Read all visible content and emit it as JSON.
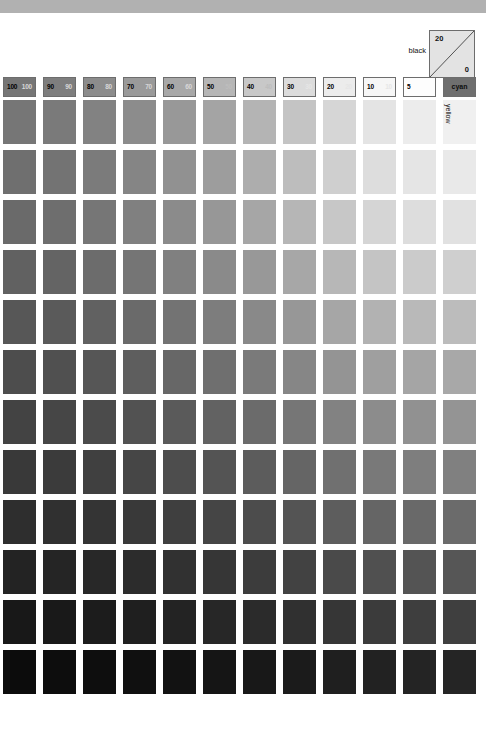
{
  "chart_data": {
    "type": "heatmap",
    "xlabel": "cyan",
    "ylabel": "yellow",
    "grid": false,
    "legend_position": "none",
    "annotations": {
      "corner_label": "black",
      "corner_top_value": "20",
      "corner_bottom_value": "0",
      "cyan_header_label": "cyan",
      "yellow_axis_label": "yellow"
    },
    "columns": [
      {
        "label": "100",
        "secondary": "100",
        "tint": 100
      },
      {
        "label": "90",
        "secondary": "90",
        "tint": 90
      },
      {
        "label": "80",
        "secondary": "80",
        "tint": 80
      },
      {
        "label": "70",
        "secondary": "70",
        "tint": 70
      },
      {
        "label": "60",
        "secondary": "60",
        "tint": 60
      },
      {
        "label": "50",
        "secondary": "50",
        "tint": 50
      },
      {
        "label": "40",
        "secondary": "40",
        "tint": 40
      },
      {
        "label": "30",
        "secondary": "30",
        "tint": 30
      },
      {
        "label": "20",
        "secondary": "20",
        "tint": 20
      },
      {
        "label": "10",
        "secondary": "10",
        "tint": 10
      },
      {
        "label": "5",
        "secondary": "",
        "tint": 5
      },
      {
        "label": "cyan",
        "secondary": "",
        "tint": -1
      }
    ],
    "rows": [
      {
        "label": "0",
        "secondary": "",
        "tint": 0
      },
      {
        "label": "5",
        "secondary": "",
        "tint": 5
      },
      {
        "label": "10",
        "secondary": "",
        "tint": 10
      },
      {
        "label": "20",
        "secondary": "20",
        "tint": 20
      },
      {
        "label": "30",
        "secondary": "30",
        "tint": 30
      },
      {
        "label": "40",
        "secondary": "40",
        "tint": 40
      },
      {
        "label": "50",
        "secondary": "50",
        "tint": 50
      },
      {
        "label": "60",
        "secondary": "60",
        "tint": 60
      },
      {
        "label": "70",
        "secondary": "70",
        "tint": 70
      },
      {
        "label": "80",
        "secondary": "80",
        "tint": 80
      },
      {
        "label": "90",
        "secondary": "90",
        "tint": 90
      },
      {
        "label": "100",
        "secondary": "100",
        "tint": 100
      }
    ],
    "header_colors": [
      "#767676",
      "#7e7e7e",
      "#8c8c8c",
      "#9a9a9a",
      "#a8a8a8",
      "#b6b6b6",
      "#c8c8c8",
      "#dcdcdc",
      "#ececec",
      "#f6f6f6",
      "#fdfdfd",
      "#6f6f6f"
    ],
    "row_label_colors": [
      "#0a0a0a",
      "#ffffff",
      "#fbfbfb",
      "#e2e2e2",
      "#c9c9c9",
      "#b2b2b2",
      "#9c9c9c",
      "#858585",
      "#6c6c6c",
      "#535353",
      "#373737",
      "#1a1a1a"
    ],
    "patch_colors": [
      [
        "#767676",
        "#7a7a7a",
        "#828282",
        "#8c8c8c",
        "#989898",
        "#a4a4a4",
        "#b4b4b4",
        "#c4c4c4",
        "#d6d6d6",
        "#e4e4e4",
        "#ececec",
        "#f0f0f0"
      ],
      [
        "#6f6f6f",
        "#737373",
        "#7b7b7b",
        "#858585",
        "#919191",
        "#9d9d9d",
        "#adadad",
        "#bdbdbd",
        "#cfcfcf",
        "#dddddd",
        "#e5e5e5",
        "#e9e9e9"
      ],
      [
        "#6a6a6a",
        "#6e6e6e",
        "#767676",
        "#808080",
        "#8b8b8b",
        "#979797",
        "#a6a6a6",
        "#b6b6b6",
        "#c7c7c7",
        "#d5d5d5",
        "#dddddd",
        "#e1e1e1"
      ],
      [
        "#616161",
        "#646464",
        "#6c6c6c",
        "#757575",
        "#808080",
        "#8a8a8a",
        "#989898",
        "#a7a7a7",
        "#b7b7b7",
        "#c4c4c4",
        "#cbcbcb",
        "#cfcfcf"
      ],
      [
        "#575757",
        "#5a5a5a",
        "#616161",
        "#6a6a6a",
        "#737373",
        "#7d7d7d",
        "#898989",
        "#979797",
        "#a6a6a6",
        "#b2b2b2",
        "#b9b9b9",
        "#bcbcbc"
      ],
      [
        "#4d4d4d",
        "#505050",
        "#565656",
        "#5e5e5e",
        "#676767",
        "#6f6f6f",
        "#7a7a7a",
        "#868686",
        "#949494",
        "#9f9f9f",
        "#a5a5a5",
        "#a8a8a8"
      ],
      [
        "#434343",
        "#464646",
        "#4b4b4b",
        "#525252",
        "#5a5a5a",
        "#626262",
        "#6b6b6b",
        "#767676",
        "#828282",
        "#8c8c8c",
        "#919191",
        "#949494"
      ],
      [
        "#393939",
        "#3b3b3b",
        "#404040",
        "#464646",
        "#4d4d4d",
        "#545454",
        "#5c5c5c",
        "#656565",
        "#707070",
        "#797979",
        "#7e7e7e",
        "#808080"
      ],
      [
        "#2e2e2e",
        "#303030",
        "#343434",
        "#393939",
        "#3f3f3f",
        "#454545",
        "#4c4c4c",
        "#545454",
        "#5d5d5d",
        "#656565",
        "#696969",
        "#6b6b6b"
      ],
      [
        "#232323",
        "#252525",
        "#282828",
        "#2c2c2c",
        "#313131",
        "#363636",
        "#3c3c3c",
        "#424242",
        "#4a4a4a",
        "#505050",
        "#545454",
        "#565656"
      ],
      [
        "#181818",
        "#191919",
        "#1c1c1c",
        "#1f1f1f",
        "#232323",
        "#272727",
        "#2b2b2b",
        "#303030",
        "#363636",
        "#3b3b3b",
        "#3e3e3e",
        "#3f3f3f"
      ],
      [
        "#0c0c0c",
        "#0d0d0d",
        "#0e0e0e",
        "#101010",
        "#121212",
        "#151515",
        "#181818",
        "#1b1b1b",
        "#1f1f1f",
        "#222222",
        "#242424",
        "#252525"
      ]
    ]
  }
}
